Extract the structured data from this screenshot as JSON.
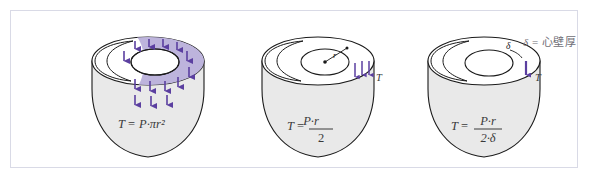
{
  "figure_title": "Laplace law applied to the ventricle: wall tension relations",
  "legend": {
    "symbol": "δ",
    "equals": "=",
    "definition": "心壁厚",
    "full_text": "δ = 心壁厚"
  },
  "colors": {
    "arrow_purple": "#5B3FA0",
    "annulus_lavender": "#BDB4DC",
    "heart_body_gray": "#E9E9E9",
    "outline_black": "#1a1a1a",
    "frame_border": "#d9dae6",
    "background": "#ffffff",
    "label_gray": "#6e6e76"
  },
  "panels": [
    {
      "id": "panel-1",
      "name": "total-force-on-valve-plane",
      "formula": {
        "lhs": "T",
        "equals": "=",
        "rhs_inline": "P·πr²",
        "numerator": null,
        "denominator": null,
        "plain": "T = P·πr²"
      },
      "annulus_shaded": true,
      "arrow_count": 12,
      "tension_label": null,
      "radius_label": null,
      "thickness_label": null
    },
    {
      "id": "panel-2",
      "name": "wall-tension-thin-wall",
      "formula": {
        "lhs": "T",
        "equals": "=",
        "rhs_inline": null,
        "numerator": "P·r",
        "denominator": "2",
        "plain": "T = P·r / 2"
      },
      "annulus_shaded": false,
      "arrow_count": 3,
      "tension_label": "T",
      "radius_label": "r",
      "thickness_label": null
    },
    {
      "id": "panel-3",
      "name": "wall-stress-with-thickness",
      "formula": {
        "lhs": "T",
        "equals": "=",
        "rhs_inline": null,
        "numerator": "P·r",
        "denominator": "2·δ",
        "plain": "T = P·r / (2·δ)"
      },
      "annulus_shaded": false,
      "arrow_count": 1,
      "tension_label": "T",
      "radius_label": null,
      "thickness_label": "δ"
    }
  ]
}
